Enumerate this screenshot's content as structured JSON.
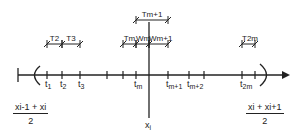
{
  "diagram": {
    "axis": {
      "left_bound_label": {
        "num": "x_{i-1} + x_i",
        "num_text": "xi-1 + xi",
        "den": "2"
      },
      "right_bound_label": {
        "num": "x_i + x_{i+1}",
        "num_text": "xi + xi+1",
        "den": "2"
      },
      "center_label": "x",
      "center_sub": "i"
    },
    "ticks": [
      {
        "id": "t1",
        "base": "t",
        "sub": "1",
        "x": 47
      },
      {
        "id": "t2",
        "base": "t",
        "sub": "2",
        "x": 62
      },
      {
        "id": "t3",
        "base": "t",
        "sub": "3",
        "x": 80
      },
      {
        "id": "blank1",
        "base": "",
        "sub": "",
        "x": 107
      },
      {
        "id": "blank2",
        "base": "",
        "sub": "",
        "x": 123
      },
      {
        "id": "tm",
        "base": "t",
        "sub": "m",
        "x": 136
      },
      {
        "id": "tm+1",
        "base": "t",
        "sub": "m+1",
        "x": 168
      },
      {
        "id": "tm+2",
        "base": "t",
        "sub": "m+2",
        "x": 189
      },
      {
        "id": "blank3",
        "base": "",
        "sub": "",
        "x": 204
      },
      {
        "id": "t2m",
        "base": "t",
        "sub": "2m",
        "x": 242
      },
      {
        "id": "blank4",
        "base": "",
        "sub": "",
        "x": 255
      }
    ],
    "intervals": [
      {
        "label": "T2",
        "x1": 47,
        "x2": 62,
        "row": 2
      },
      {
        "label": "T3",
        "x1": 62,
        "x2": 80,
        "row": 2
      },
      {
        "label": "Tm",
        "x1": 123,
        "x2": 136,
        "row": 2
      },
      {
        "label": "Wm",
        "x1": 136,
        "x2": 149,
        "row": 2
      },
      {
        "label": "Wm+1",
        "x1": 149,
        "x2": 168,
        "row": 2
      },
      {
        "label": "Tm+1",
        "x1": 136,
        "x2": 168,
        "row": 1
      },
      {
        "label": "T2m",
        "x1": 242,
        "x2": 255,
        "row": 2
      }
    ],
    "colors": {
      "ink": "#222222",
      "background": "#ffffff"
    }
  }
}
